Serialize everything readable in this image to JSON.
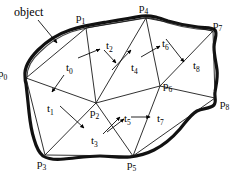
{
  "figure": {
    "title": "object",
    "colors": {
      "outline": "#000000",
      "mesh": "#000000",
      "background": "#ffffff",
      "text": "#000000"
    },
    "annotation": {
      "label": "object",
      "x": 14,
      "y": 6,
      "arrow_from": [
        38,
        20
      ],
      "arrow_to": [
        57,
        43
      ]
    }
  },
  "chart_data": {
    "type": "diagram",
    "title": "object",
    "xlabel": "",
    "ylabel": "",
    "vertices": [
      {
        "id": "p0",
        "base": "p",
        "sub": "0",
        "x": 26,
        "y": 78,
        "label_x": -2,
        "label_y": 68
      },
      {
        "id": "p1",
        "base": "p",
        "sub": "1",
        "x": 86,
        "y": 28,
        "label_x": 76,
        "label_y": 12
      },
      {
        "id": "p2",
        "base": "p",
        "sub": "2",
        "x": 96,
        "y": 103,
        "label_x": 90,
        "label_y": 107
      },
      {
        "id": "p3",
        "base": "p",
        "sub": "3",
        "x": 45,
        "y": 155,
        "label_x": 37,
        "label_y": 158
      },
      {
        "id": "p4",
        "base": "p",
        "sub": "4",
        "x": 146,
        "y": 18,
        "label_x": 139,
        "label_y": 2
      },
      {
        "id": "p5",
        "base": "p",
        "sub": "5",
        "x": 133,
        "y": 156,
        "label_x": 127,
        "label_y": 159
      },
      {
        "id": "p6",
        "base": "p",
        "sub": "6",
        "x": 160,
        "y": 86,
        "label_x": 163,
        "label_y": 80
      },
      {
        "id": "p7",
        "base": "p",
        "sub": "7",
        "x": 213,
        "y": 31,
        "label_x": 213,
        "label_y": 19
      },
      {
        "id": "p8",
        "base": "p",
        "sub": "8",
        "x": 215,
        "y": 98,
        "label_x": 220,
        "label_y": 98
      }
    ],
    "triangles": [
      {
        "id": "t0",
        "base": "t",
        "sub": "0",
        "verts": [
          "p0",
          "p1",
          "p2"
        ],
        "label_x": 66,
        "label_y": 62,
        "arrow_from": [
          64,
          75
        ],
        "arrow_to": [
          52,
          92
        ]
      },
      {
        "id": "t1",
        "base": "t",
        "sub": "1",
        "verts": [
          "p0",
          "p2",
          "p3"
        ],
        "label_x": 47,
        "label_y": 103,
        "arrow_from": [
          60,
          106
        ],
        "arrow_to": [
          84,
          128
        ]
      },
      {
        "id": "t2",
        "base": "t",
        "sub": "2",
        "verts": [
          "p1",
          "p4",
          "p2"
        ],
        "label_x": 106,
        "label_y": 40,
        "arrow_from": [
          78,
          58
        ],
        "arrow_to": [
          100,
          49
        ]
      },
      {
        "id": "t3",
        "base": "t",
        "sub": "3",
        "verts": [
          "p2",
          "p5",
          "p3"
        ],
        "label_x": 91,
        "label_y": 135,
        "arrow_from": [
          107,
          132
        ],
        "arrow_to": [
          124,
          119
        ]
      },
      {
        "id": "t4",
        "base": "t",
        "sub": "4",
        "verts": [
          "p2",
          "p4",
          "p6"
        ],
        "label_x": 131,
        "label_y": 62,
        "arrow_from": [
          112,
          70
        ],
        "arrow_to": [
          131,
          50
        ]
      },
      {
        "id": "t5",
        "base": "t",
        "sub": "5",
        "verts": [
          "p2",
          "p6",
          "p5"
        ],
        "label_x": 124,
        "label_y": 113,
        "arrow_from": [
          103,
          134
        ],
        "arrow_to": [
          120,
          117
        ]
      },
      {
        "id": "t6",
        "base": "t",
        "sub": "6",
        "verts": [
          "p4",
          "p7",
          "p6"
        ],
        "label_x": 162,
        "label_y": 38,
        "arrow_from": [
          141,
          57
        ],
        "arrow_to": [
          160,
          46
        ]
      },
      {
        "id": "t7",
        "base": "t",
        "sub": "7",
        "verts": [
          "p6",
          "p8",
          "p5"
        ],
        "label_x": 157,
        "label_y": 113,
        "arrow_from": [
          131,
          117
        ],
        "arrow_to": [
          150,
          117
        ]
      },
      {
        "id": "t8",
        "base": "t",
        "sub": "8",
        "verts": [
          "p7",
          "p8",
          "p6"
        ],
        "label_x": 193,
        "label_y": 60,
        "arrow_from": [
          166,
          39
        ],
        "arrow_to": [
          184,
          62
        ]
      }
    ],
    "edges": [
      [
        "p0",
        "p1"
      ],
      [
        "p1",
        "p4"
      ],
      [
        "p4",
        "p7"
      ],
      [
        "p7",
        "p8"
      ],
      [
        "p8",
        "p5"
      ],
      [
        "p5",
        "p3"
      ],
      [
        "p3",
        "p0"
      ],
      [
        "p0",
        "p2"
      ],
      [
        "p1",
        "p2"
      ],
      [
        "p2",
        "p4"
      ],
      [
        "p2",
        "p3"
      ],
      [
        "p2",
        "p5"
      ],
      [
        "p2",
        "p6"
      ],
      [
        "p4",
        "p6"
      ],
      [
        "p6",
        "p7"
      ],
      [
        "p6",
        "p8"
      ],
      [
        "p6",
        "p5"
      ]
    ],
    "outline_closed": true
  }
}
